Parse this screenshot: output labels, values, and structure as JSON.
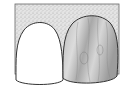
{
  "illustration": {
    "subject": "two front teeth against stippled gum background",
    "background_color": "#ffffff",
    "gum_fill": "#d8d8d8",
    "stroke_color": "#333333",
    "left_tooth": {
      "label": "",
      "fill": "#ffffff"
    },
    "right_tooth": {
      "label": "",
      "fill": "#c4c4c4",
      "texture": "woodgrain"
    }
  }
}
